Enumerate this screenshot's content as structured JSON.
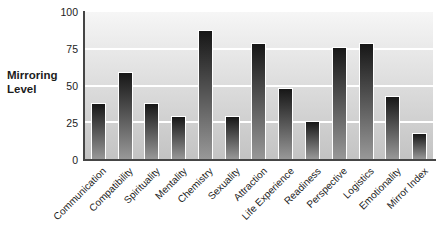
{
  "chart_data": {
    "type": "bar",
    "title": "",
    "ylabel": "Mirroring Level",
    "ylabel_lines": [
      "Mirroring",
      "Level"
    ],
    "xlabel": "",
    "categories": [
      "Communication",
      "Compatibility",
      "Spirituality",
      "Mentality",
      "Chemistry",
      "Sexuality",
      "Attraction",
      "Life Experience",
      "Readiness",
      "Perspective",
      "Logistics",
      "Emotionality",
      "Mirror Index"
    ],
    "values": [
      38,
      59,
      38,
      29,
      88,
      29,
      79,
      48,
      26,
      76,
      79,
      43,
      18
    ],
    "yticks": [
      0,
      25,
      50,
      75,
      100
    ],
    "ylim": [
      0,
      100
    ],
    "grid": "horizontal",
    "legend": "none",
    "category_label_rotation_deg": 45,
    "colors": {
      "bar_gradient_top": "#171717",
      "bar_gradient_bottom": "#989898",
      "bar_outline": "#ffffff",
      "plot_bg_top": "#f6f6f6",
      "plot_bg_bottom": "#c3c3c3",
      "gridline": "#ffffff",
      "axis": "#454545",
      "text": "#1c1c1c"
    }
  }
}
